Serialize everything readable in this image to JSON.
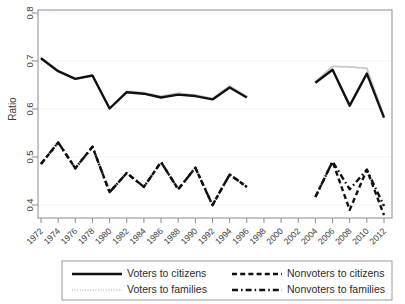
{
  "chart_data": {
    "type": "line",
    "title": "",
    "xlabel": "",
    "ylabel": "Ratio",
    "ylim": [
      0.365,
      0.8
    ],
    "xlim": [
      1972,
      2012
    ],
    "grid": true,
    "legend_position": "below",
    "x_ticks": [
      "1972",
      "1974",
      "1976",
      "1978",
      "1980",
      "1982",
      "1984",
      "1986",
      "1988",
      "1990",
      "1992",
      "1994",
      "1996",
      "1998",
      "2000",
      "2002",
      "2004",
      "2006",
      "2008",
      "2010",
      "2012"
    ],
    "y_ticks": [
      "0.4",
      "0.5",
      "0.6",
      "0.7",
      "0.8"
    ],
    "y_tick_values": [
      0.4,
      0.5,
      0.6,
      0.7,
      0.8
    ],
    "note": "Data gap between 1996 and 2004; no observations for 1998, 2000, 2002.",
    "series": [
      {
        "name": "Voters to citizens",
        "style": "solid",
        "color": "#111111",
        "x": [
          1972,
          1974,
          1976,
          1978,
          1980,
          1982,
          1984,
          1986,
          1988,
          1990,
          1992,
          1994,
          1996
        ],
        "values": [
          0.699,
          0.672,
          0.656,
          0.663,
          0.594,
          0.628,
          0.625,
          0.617,
          0.623,
          0.62,
          0.613,
          0.638,
          0.617
        ]
      },
      {
        "name": "Voters to citizens",
        "style": "solid",
        "color": "#111111",
        "segment": 2,
        "x": [
          2004,
          2006,
          2008,
          2010,
          2012
        ],
        "values": [
          0.648,
          0.675,
          0.6,
          0.667,
          0.575
        ]
      },
      {
        "name": "Voters to families",
        "style": "dotted",
        "color": "#c9c9c9",
        "x": [
          1972,
          1974,
          1976,
          1978,
          1980,
          1982,
          1984,
          1986,
          1988,
          1990,
          1992,
          1994,
          1996
        ],
        "values": [
          0.699,
          0.672,
          0.656,
          0.663,
          0.594,
          0.63,
          0.627,
          0.62,
          0.626,
          0.622,
          0.615,
          0.641,
          0.619
        ]
      },
      {
        "name": "Voters to families",
        "style": "dotted",
        "color": "#c9c9c9",
        "segment": 2,
        "x": [
          2004,
          2006,
          2008,
          2010,
          2012
        ],
        "values": [
          0.65,
          0.682,
          0.681,
          0.678,
          0.578
        ]
      },
      {
        "name": "Nonvoters to citizens",
        "style": "dashed",
        "color": "#111111",
        "x": [
          1972,
          1974,
          1976,
          1978,
          1980,
          1982,
          1984,
          1986,
          1988,
          1990,
          1992,
          1994,
          1996
        ],
        "values": [
          0.478,
          0.523,
          0.469,
          0.514,
          0.419,
          0.459,
          0.43,
          0.482,
          0.425,
          0.47,
          0.392,
          0.456,
          0.43
        ]
      },
      {
        "name": "Nonvoters to citizens",
        "style": "dashed",
        "color": "#111111",
        "segment": 2,
        "x": [
          2004,
          2006,
          2008,
          2010,
          2012
        ],
        "values": [
          0.409,
          0.483,
          0.382,
          0.466,
          0.371
        ]
      },
      {
        "name": "Nonvoters to families",
        "style": "dash-dot",
        "color": "#111111",
        "x": [
          1972,
          1974,
          1976,
          1978,
          1980,
          1982,
          1984,
          1986,
          1988,
          1990,
          1992,
          1994,
          1996
        ],
        "values": [
          0.478,
          0.523,
          0.469,
          0.514,
          0.419,
          0.459,
          0.43,
          0.482,
          0.425,
          0.47,
          0.392,
          0.456,
          0.43
        ]
      },
      {
        "name": "Nonvoters to families",
        "style": "dash-dot",
        "color": "#111111",
        "segment": 2,
        "x": [
          2004,
          2006,
          2008,
          2010,
          2012
        ],
        "values": [
          0.409,
          0.483,
          0.425,
          0.466,
          0.39
        ]
      }
    ]
  },
  "axis": {
    "y_title": "Ratio",
    "y_labels": [
      "0.8",
      "0.7",
      "0.6",
      "0.5",
      "0.4"
    ],
    "x_labels": [
      "1972",
      "1974",
      "1976",
      "1978",
      "1980",
      "1982",
      "1984",
      "1986",
      "1988",
      "1990",
      "1992",
      "1994",
      "1996",
      "1998",
      "2000",
      "2002",
      "2004",
      "2006",
      "2008",
      "2010",
      "2012"
    ]
  },
  "legend": {
    "entries": [
      {
        "label": "Voters to citizens",
        "style": "solid",
        "color": "#111111"
      },
      {
        "label": "Nonvoters to citizens",
        "style": "dashed",
        "color": "#111111"
      },
      {
        "label": "Voters to families",
        "style": "dotted",
        "color": "#c9c9c9"
      },
      {
        "label": "Nonvoters to families",
        "style": "dash-dot",
        "color": "#111111"
      }
    ]
  }
}
